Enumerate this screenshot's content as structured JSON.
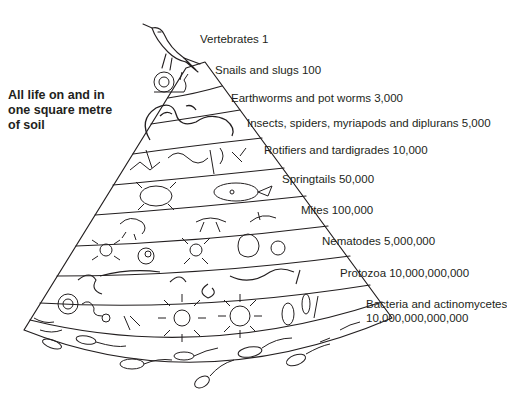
{
  "title": {
    "line1": "All life on and in",
    "line2": "one square metre",
    "line3": "of soil"
  },
  "levels": [
    {
      "name": "Vertebrates",
      "count": "1",
      "label": "Vertebrates 1"
    },
    {
      "name": "Snails and slugs",
      "count": "100",
      "label": "Snails and slugs 100"
    },
    {
      "name": "Earthworms and pot worms",
      "count": "3,000",
      "label": "Earthworms and pot worms 3,000"
    },
    {
      "name": "Insects, spiders, myriapods and diplurans",
      "count": "5,000",
      "label": "Insects, spiders, myriapods and diplurans 5,000"
    },
    {
      "name": "Rotifiers and tardigrades",
      "count": "10,000",
      "label": "Rotifiers and tardigrades 10,000"
    },
    {
      "name": "Springtails",
      "count": "50,000",
      "label": "Springtails 50,000"
    },
    {
      "name": "Mites",
      "count": "100,000",
      "label": "Mites 100,000"
    },
    {
      "name": "Nematodes",
      "count": "5,000,000",
      "label": "Nematodes 5,000,000"
    },
    {
      "name": "Protozoa",
      "count": "10,000,000,000",
      "label": "Protozoa 10,000,000,000"
    },
    {
      "name": "Bacteria and actinomycetes",
      "count": "10,000,000,000,000",
      "label_line1": "Bacteria and actinomycetes",
      "label_line2": "10,000,000,000,000"
    }
  ],
  "colors": {
    "ink": "#231f20",
    "background": "#ffffff"
  }
}
